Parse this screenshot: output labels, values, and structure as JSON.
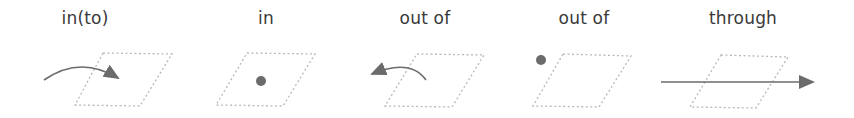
{
  "diagram": {
    "title": "",
    "colors": {
      "text": "#3a3a3a",
      "arrow": "#6b6b6b",
      "dot": "#6b6b6b",
      "plane_outline": "#b8b8b8"
    },
    "panels": [
      {
        "id": "into",
        "label": "in(to)",
        "label_x": 85,
        "depiction": "arrow curving from outside into the plane"
      },
      {
        "id": "in",
        "label": "in",
        "label_x": 266,
        "depiction": "dot inside the plane"
      },
      {
        "id": "out_of_motion",
        "label": "out of",
        "label_x": 425,
        "depiction": "arrow curving out of the plane"
      },
      {
        "id": "out_of_static",
        "label": "out of",
        "label_x": 584,
        "depiction": "dot outside the plane"
      },
      {
        "id": "through",
        "label": "through",
        "label_x": 743,
        "depiction": "straight arrow passing through the plane"
      }
    ]
  }
}
